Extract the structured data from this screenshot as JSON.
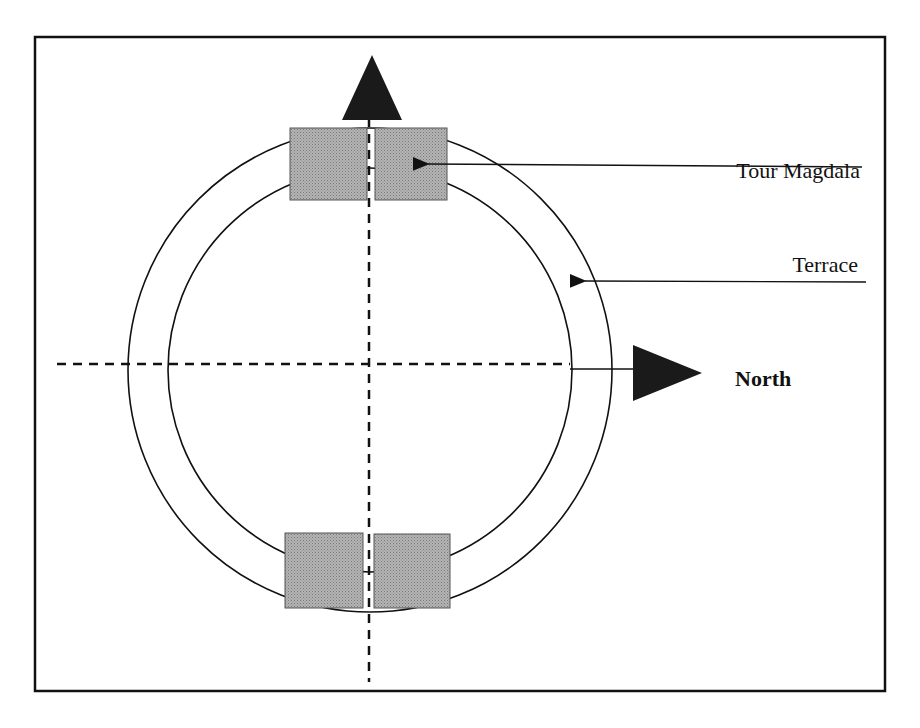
{
  "diagram": {
    "labels": {
      "tour_magdala": "Tour Magdala",
      "terrace": "Terrace",
      "north": "North"
    },
    "colors": {
      "line": "#111111",
      "tower_fill": "#a6a6a6",
      "arrow_fill": "#1a1a1a",
      "background": "#ffffff"
    },
    "elements": {
      "outer_circle": {
        "cx": 370,
        "cy": 370,
        "r": 242
      },
      "inner_circle": {
        "cx": 370,
        "cy": 370,
        "r": 202
      },
      "towers": [
        {
          "position": "top-left",
          "x": 290,
          "y": 128,
          "w": 77,
          "h": 72
        },
        {
          "position": "top-right",
          "x": 375,
          "y": 128,
          "w": 72,
          "h": 72
        },
        {
          "position": "bottom-left",
          "x": 285,
          "y": 533,
          "w": 78,
          "h": 75
        },
        {
          "position": "bottom-right",
          "x": 374,
          "y": 534,
          "w": 76,
          "h": 74
        }
      ]
    }
  }
}
